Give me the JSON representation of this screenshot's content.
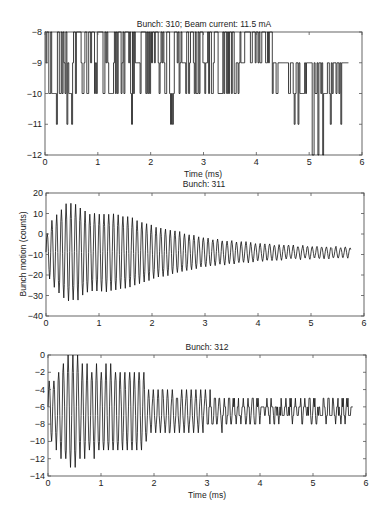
{
  "chart_data": [
    {
      "type": "line",
      "title": "Bunch: 310; Beam current: 11.5 mA",
      "xlabel": "Time  (ms)",
      "ylabel": "",
      "xlim": [
        0,
        6
      ],
      "ylim": [
        -12,
        -8
      ],
      "xticks": [
        "0",
        "1",
        "2",
        "3",
        "4",
        "5",
        "6"
      ],
      "yticks": [
        "-8",
        "-9",
        "-10",
        "-11",
        "-12"
      ],
      "grid": false,
      "description": "Quantized noise toggling between -8, -9, -10 with occasional dips to -11 and -12, from t=0 to ~5.75 ms",
      "series": [
        {
          "name": "bunch-310",
          "x_range": [
            0,
            5.75
          ],
          "levels": [
            -8,
            -9,
            -10,
            -11,
            -12
          ],
          "segments": [
            {
              "t0": 0.0,
              "t1": 0.9,
              "low": -10,
              "high": -8,
              "dips": [
                0.22,
                0.42,
                0.5
              ]
            },
            {
              "t0": 0.9,
              "t1": 1.6,
              "low": -10,
              "high": -8,
              "dips": []
            },
            {
              "t0": 1.6,
              "t1": 2.6,
              "low": -10,
              "high": -8,
              "dips": [
                1.63,
                2.38,
                2.42
              ]
            },
            {
              "t0": 2.6,
              "t1": 3.7,
              "low": -10,
              "high": -8,
              "dips": []
            },
            {
              "t0": 3.7,
              "t1": 4.3,
              "low": -9,
              "high": -8,
              "dips": [
                4.3
              ]
            },
            {
              "t0": 4.3,
              "t1": 5.75,
              "low": -10,
              "high": -9,
              "dips": [
                4.72,
                4.78,
                5.05,
                5.17,
                5.25,
                5.4,
                5.6
              ]
            }
          ]
        }
      ]
    },
    {
      "type": "line",
      "title": "Bunch: 311",
      "xlabel": "",
      "ylabel": "Bunch motion  (counts)",
      "xlim": [
        0,
        6
      ],
      "ylim": [
        -40,
        20
      ],
      "xticks": [
        "0",
        "1",
        "2",
        "3",
        "4",
        "5",
        "6"
      ],
      "yticks": [
        "20",
        "10",
        "0",
        "-10",
        "-20",
        "-30",
        "-40"
      ],
      "grid": false,
      "description": "Damped oscillation around ~-9 counts, ~11 cycles/ms; amplitude grows to ~24 at 0.4 ms, decays to ~3 by 5.75 ms",
      "series": [
        {
          "name": "bunch-311",
          "x_range": [
            0,
            5.75
          ],
          "offset": -9,
          "freq_per_ms": 11.2,
          "envelope": [
            [
              0,
              8
            ],
            [
              0.1,
              15
            ],
            [
              0.25,
              20
            ],
            [
              0.4,
              24
            ],
            [
              0.6,
              23
            ],
            [
              0.8,
              19
            ],
            [
              1.2,
              19
            ],
            [
              1.6,
              17
            ],
            [
              2.0,
              13
            ],
            [
              2.5,
              10
            ],
            [
              3.0,
              7
            ],
            [
              3.5,
              5.5
            ],
            [
              4.0,
              4.5
            ],
            [
              4.5,
              3.5
            ],
            [
              5.0,
              3
            ],
            [
              5.75,
              2.5
            ]
          ]
        }
      ]
    },
    {
      "type": "line",
      "title": "Bunch: 312",
      "xlabel": "Time  (ms)",
      "ylabel": "",
      "xlim": [
        0,
        6
      ],
      "ylim": [
        -14,
        0
      ],
      "xticks": [
        "0",
        "1",
        "2",
        "3",
        "4",
        "5",
        "6"
      ],
      "yticks": [
        "0",
        "-2",
        "-4",
        "-6",
        "-8",
        "-10",
        "-12",
        "-14"
      ],
      "grid": false,
      "description": "Oscillation around ~-6.5 counts with quantized steps, peaks reach 0 and troughs -13 near 0.3-0.4 ms; amplitude drops sharply after ~1.8 ms and becomes noisy near -6",
      "series": [
        {
          "name": "bunch-312",
          "x_range": [
            0,
            5.75
          ],
          "offset": -6.5,
          "freq_per_ms": 11.2,
          "envelope": [
            [
              0,
              3
            ],
            [
              0.15,
              4
            ],
            [
              0.3,
              6
            ],
            [
              0.45,
              6.5
            ],
            [
              0.6,
              5.5
            ],
            [
              1.0,
              5
            ],
            [
              1.5,
              4.5
            ],
            [
              1.8,
              4.5
            ],
            [
              1.9,
              2.5
            ],
            [
              2.6,
              2.2
            ],
            [
              3.0,
              1.8
            ],
            [
              3.4,
              1.2
            ],
            [
              4.0,
              1.0
            ],
            [
              5.0,
              0.8
            ],
            [
              5.75,
              0.8
            ]
          ]
        }
      ]
    }
  ]
}
